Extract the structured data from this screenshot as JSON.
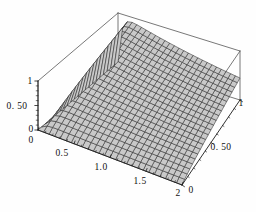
{
  "figure": {
    "type": "surface-plot-3d",
    "background_color": "#ffffff",
    "line_color": "#1a1a1a",
    "mesh_color": "#2b2b2b",
    "face_color": "#c9c9c9",
    "box_color": "#555555"
  },
  "axes": {
    "x": {
      "label": "",
      "range": [
        0,
        2
      ],
      "ticks": [
        "0",
        "0.5",
        "1.0",
        "1.5",
        "2"
      ],
      "tick_values": [
        0,
        0.5,
        1.0,
        1.5,
        2.0
      ]
    },
    "y": {
      "label": "",
      "range": [
        0,
        1
      ],
      "ticks": [
        "0",
        "0. 50",
        "1"
      ],
      "tick_values": [
        0,
        0.5,
        1.0
      ]
    },
    "z": {
      "label": "",
      "range": [
        0,
        1
      ],
      "ticks": [
        "0",
        "0. 50",
        "1"
      ],
      "tick_values": [
        0,
        0.5,
        1.0
      ]
    }
  },
  "chart_data": {
    "type": "surface",
    "title": "",
    "xlabel": "",
    "ylabel": "",
    "zlabel": "",
    "xlim": [
      0,
      2
    ],
    "ylim": [
      0,
      1
    ],
    "zlim": [
      0,
      1
    ],
    "grid": true,
    "legend": false,
    "mesh_divisions_x": 26,
    "mesh_divisions_y": 22,
    "surface_description": "Ridge rising sharply to z=1 near x=0 then decaying along x; value falls toward the front corner (x=2, y=0).",
    "x_ticks": [
      0,
      0.5,
      1.0,
      1.5,
      2.0
    ],
    "y_ticks": [
      0,
      0.5,
      1.0
    ],
    "z_ticks": [
      0,
      0.5,
      1.0
    ],
    "x_tick_labels": [
      "0",
      "0.5",
      "1.0",
      "1.5",
      "2"
    ],
    "y_tick_labels": [
      "0",
      "0. 50",
      "1"
    ],
    "z_tick_labels": [
      "0",
      "0. 50",
      "1"
    ],
    "z_of_xy_samples": [
      {
        "x": 0.0,
        "y": 0.0,
        "z": 0.0
      },
      {
        "x": 0.0,
        "y": 0.5,
        "z": 0.0
      },
      {
        "x": 0.0,
        "y": 1.0,
        "z": 0.0
      },
      {
        "x": 0.08,
        "y": 1.0,
        "z": 0.99
      },
      {
        "x": 0.08,
        "y": 0.5,
        "z": 0.62
      },
      {
        "x": 0.08,
        "y": 0.1,
        "z": 0.17
      },
      {
        "x": 0.5,
        "y": 1.0,
        "z": 0.86
      },
      {
        "x": 0.5,
        "y": 0.5,
        "z": 0.52
      },
      {
        "x": 0.5,
        "y": 0.0,
        "z": 0.02
      },
      {
        "x": 1.0,
        "y": 1.0,
        "z": 0.72
      },
      {
        "x": 1.0,
        "y": 0.5,
        "z": 0.4
      },
      {
        "x": 1.0,
        "y": 0.0,
        "z": 0.01
      },
      {
        "x": 1.5,
        "y": 1.0,
        "z": 0.6
      },
      {
        "x": 1.5,
        "y": 0.5,
        "z": 0.3
      },
      {
        "x": 2.0,
        "y": 1.0,
        "z": 0.5
      },
      {
        "x": 2.0,
        "y": 0.5,
        "z": 0.22
      },
      {
        "x": 2.0,
        "y": 0.0,
        "z": 0.0
      }
    ]
  },
  "tick_labels": {
    "z_top": "1",
    "z_mid": "0. 50",
    "z_zero": "0",
    "x_origin": "0",
    "x_half": "0.5",
    "x_one": "1.0",
    "x_one_half": "1.5",
    "x_two": "2",
    "y_zero": "0",
    "y_half": "0. 50",
    "y_one": "1"
  }
}
